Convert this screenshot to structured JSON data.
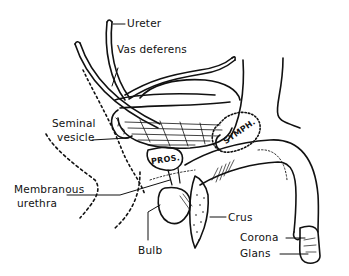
{
  "figure": {
    "type": "anatomical-line-drawing",
    "labels": {
      "ureter": "Ureter",
      "vas_deferens": "Vas deferens",
      "seminal_vesicle_line1": "Seminal",
      "seminal_vesicle_line2": "vesicle",
      "membranous_urethra_line1": "Membranous",
      "membranous_urethra_line2": "urethra",
      "bulb": "Bulb",
      "crus": "Crus",
      "corona": "Corona",
      "glans": "Glans",
      "prostate": "PROS.",
      "symphysis": "SYMPH."
    },
    "colors": {
      "ink": "#111111",
      "background": "#ffffff"
    }
  }
}
